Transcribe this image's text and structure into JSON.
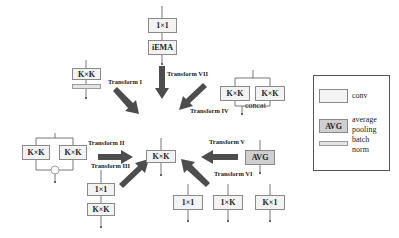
{
  "transforms": {
    "t1": "Transform I",
    "t2": "Transform II",
    "t3": "Transform III",
    "t4": "Transform IV",
    "t5": "Transform V",
    "t6": "Transform VI",
    "t7": "Transform VII"
  },
  "blocks": {
    "center": "K×K",
    "t1_conv": "K×K",
    "t7_conv": "1×1",
    "t7_iema": "iEMA",
    "t4_left": "K×K",
    "t4_right": "K×K",
    "t4_concat": "concat",
    "t2_left": "K×K",
    "t2_right": "K×K",
    "t2_add": "+",
    "t5_avg": "AVG",
    "t3_top": "1×1",
    "t3_bottom": "K×K",
    "t6_a": "1×1",
    "t6_b": "1×K",
    "t6_c": "K×1"
  },
  "legend": {
    "conv_label": "conv",
    "avg_box": "AVG",
    "avg_label_1": "average",
    "avg_label_2": "pooling",
    "bn_label_1": "batch",
    "bn_label_2": "norm"
  },
  "colors": {
    "arrow": "#4d4d4d",
    "box_fill": "#f3f3f3",
    "avg_fill": "#cfcfcf",
    "border": "#8a8a8a"
  }
}
